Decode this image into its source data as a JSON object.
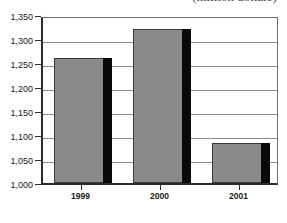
{
  "chart_data": {
    "type": "bar",
    "title": "(million dollars)",
    "xlabel": "",
    "ylabel": "",
    "categories": [
      "1999",
      "2000",
      "2001"
    ],
    "values": [
      1260,
      1320,
      1083
    ],
    "ylim": [
      1000,
      1350
    ],
    "yticks": [
      1000,
      1050,
      1100,
      1150,
      1200,
      1250,
      1300,
      1350
    ],
    "ytick_labels": [
      "1,000",
      "1,050",
      "1,100",
      "1,150",
      "1,200",
      "1,250",
      "1,300",
      "1,350"
    ],
    "grid": true,
    "legend": false,
    "series": [
      {
        "name": "Value",
        "values": [
          1260,
          1320,
          1083
        ]
      }
    ],
    "colors": {
      "bar_fill": "#8a8a8a",
      "bar_outline": "#3a3a3a",
      "bar_shadow": "#090909",
      "gridline": "#8d8d8d",
      "axis": "#2b2b2b",
      "text": "#1a1a1a",
      "background": "#ffffff"
    }
  }
}
